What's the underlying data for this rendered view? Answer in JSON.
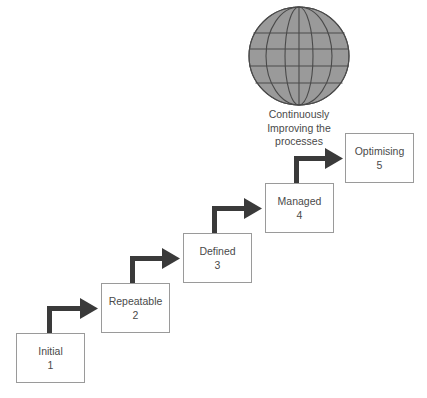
{
  "diagram": {
    "background_color": "#ffffff",
    "box_border_color": "#9a9a9a",
    "arrow_color": "#3a3a3a",
    "text_color": "#4a4a4a",
    "globe": {
      "icon_name": "globe-icon",
      "fill_color": "#9a9a9a",
      "line_color": "#4a4a4a",
      "caption_lines": [
        "Continuously",
        "Improving the",
        "processes"
      ]
    },
    "stages": [
      {
        "label": "Initial",
        "number": "1",
        "x": 16,
        "y": 333,
        "w": 69,
        "h": 50
      },
      {
        "label": "Repeatable",
        "number": "2",
        "x": 101,
        "y": 283,
        "w": 69,
        "h": 50
      },
      {
        "label": "Defined",
        "number": "3",
        "x": 183,
        "y": 233,
        "w": 69,
        "h": 50
      },
      {
        "label": "Managed",
        "number": "4",
        "x": 265,
        "y": 183,
        "w": 69,
        "h": 50
      },
      {
        "label": "Optimising",
        "number": "5",
        "x": 345,
        "y": 133,
        "w": 69,
        "h": 50
      }
    ],
    "arrows": [
      {
        "name": "arrow-initial-to-repeatable",
        "from": "Initial",
        "to": "Repeatable"
      },
      {
        "name": "arrow-repeatable-to-defined",
        "from": "Repeatable",
        "to": "Defined"
      },
      {
        "name": "arrow-defined-to-managed",
        "from": "Defined",
        "to": "Managed"
      },
      {
        "name": "arrow-managed-to-optimising",
        "from": "Managed",
        "to": "Optimising"
      }
    ]
  }
}
